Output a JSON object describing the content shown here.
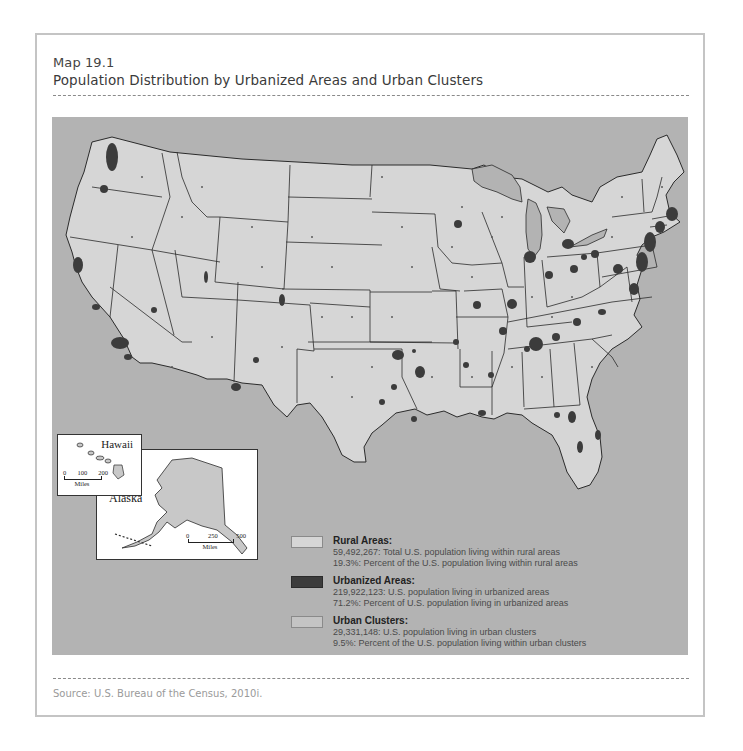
{
  "header": {
    "label": "Map 19.1",
    "title": "Population Distribution by Urbanized Areas and Urban Clusters"
  },
  "footer": {
    "source": "Source: U.S. Bureau of the Census, 2010i."
  },
  "colors": {
    "background": "#b3b3b3",
    "rural": "#d6d6d6",
    "urbanized": "#3c3c3c",
    "urban_clusters": "#c4c4c4",
    "border": "#2b2b2b",
    "water": "#b3b3b3"
  },
  "insets": {
    "hawaii": {
      "name": "Hawaii",
      "scale_ticks": [
        "0",
        "100",
        "200"
      ],
      "scale_unit": "Miles"
    },
    "alaska": {
      "name": "Alaska",
      "scale_ticks": [
        "0",
        "250",
        "500"
      ],
      "scale_unit": "Miles"
    }
  },
  "legend": {
    "items": [
      {
        "key": "rural",
        "title": "Rural Areas:",
        "lines": [
          "59,492,267: Total U.S. population living within rural areas",
          "19.3%: Percent of the U.S. population living within rural areas"
        ]
      },
      {
        "key": "urbanized",
        "title": "Urbanized Areas:",
        "lines": [
          "219,922,123: U.S. population living in urbanized areas",
          "71.2%: Percent of U.S. population living in urbanized areas"
        ]
      },
      {
        "key": "urban_clusters",
        "title": "Urban Clusters:",
        "lines": [
          "29,331,148: U.S. population living in urban clusters",
          "9.5%: Percent of the U.S. population living within urban clusters"
        ]
      }
    ]
  }
}
